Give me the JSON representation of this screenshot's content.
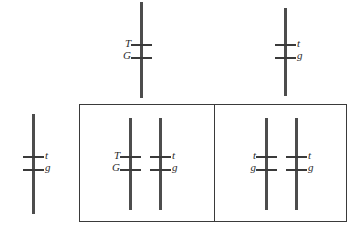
{
  "figure": {
    "type": "genetics-chromosome-diagram",
    "background_color": "#ffffff",
    "chromosome_color": "#4d4d4d",
    "crossbar_color": "#3a3a3a",
    "box_border_color": "#3a3a3a",
    "label_color": "#2b2b2b"
  },
  "chromosomes": [
    {
      "id": "top-center-chromosome",
      "x": 140,
      "y": 2,
      "height": 96,
      "label_side": "left",
      "alleles": [
        {
          "text": "T",
          "y": 38
        },
        {
          "text": "G",
          "y": 50
        }
      ],
      "crossbars": [
        44,
        57
      ]
    },
    {
      "id": "top-right-chromosome",
      "x": 284,
      "y": 8,
      "height": 88,
      "label_side": "right",
      "alleles": [
        {
          "text": "t",
          "y": 38
        },
        {
          "text": "g",
          "y": 50
        }
      ],
      "crossbars": [
        44,
        57
      ]
    },
    {
      "id": "left-standalone-chromosome",
      "x": 32,
      "y": 114,
      "height": 100,
      "label_side": "right",
      "alleles": [
        {
          "text": "t",
          "y": 150
        },
        {
          "text": "g",
          "y": 162
        }
      ],
      "crossbars": [
        156,
        169
      ]
    },
    {
      "id": "cell-one-chromosome-left",
      "x": 129,
      "y": 118,
      "height": 92,
      "label_side": "left",
      "alleles": [
        {
          "text": "T",
          "y": 150
        },
        {
          "text": "G",
          "y": 162
        }
      ],
      "crossbars": [
        156,
        169
      ]
    },
    {
      "id": "cell-one-chromosome-right",
      "x": 159,
      "y": 118,
      "height": 92,
      "label_side": "right",
      "alleles": [
        {
          "text": "t",
          "y": 150
        },
        {
          "text": "g",
          "y": 162
        }
      ],
      "crossbars": [
        156,
        169
      ]
    },
    {
      "id": "cell-two-chromosome-left",
      "x": 265,
      "y": 118,
      "height": 92,
      "label_side": "left",
      "alleles": [
        {
          "text": "t",
          "y": 150
        },
        {
          "text": "g",
          "y": 162
        }
      ],
      "crossbars": [
        156,
        169
      ]
    },
    {
      "id": "cell-two-chromosome-right",
      "x": 295,
      "y": 118,
      "height": 92,
      "label_side": "right",
      "alleles": [
        {
          "text": "t",
          "y": 150
        },
        {
          "text": "g",
          "y": 162
        }
      ],
      "crossbars": [
        156,
        169
      ]
    }
  ],
  "cell_box": {
    "x": 79,
    "y": 104,
    "width": 268,
    "height": 118,
    "divider_x": 214
  }
}
